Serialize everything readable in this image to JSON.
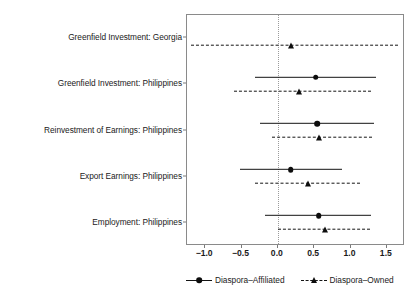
{
  "chart_data": {
    "type": "scatter",
    "subtype": "coefficient-forest-plot",
    "title": "",
    "subtitle": "",
    "xlabel": "",
    "ylabel": "",
    "xlim": [
      -1.25,
      1.75
    ],
    "xticks": [
      -1.0,
      -0.5,
      0.0,
      0.5,
      1.0,
      1.5
    ],
    "xticklabels": [
      "-1.0",
      "-0.5",
      "0.0",
      "0.5",
      "1.0",
      "1.5"
    ],
    "grid": false,
    "zero_reference_line": 0.0,
    "legend_position": "bottom",
    "categories": [
      "Greenfield Investment: Georgia",
      "Greenfield Investment: Philippines",
      "Reinvestment of Earnings: Philippines",
      "Export Earnings: Philippines",
      "Employment: Philippines"
    ],
    "series": [
      {
        "name": "Diaspora-Affiliated",
        "marker": "circle",
        "linestyle": "solid",
        "color": "#0d0d0d",
        "points": [
          {
            "category": "Greenfield Investment: Georgia",
            "estimate": null,
            "low": null,
            "high": null
          },
          {
            "category": "Greenfield Investment: Philippines",
            "estimate": 0.52,
            "low": -0.32,
            "high": 1.35
          },
          {
            "category": "Reinvestment of Earnings: Philippines",
            "estimate": 0.54,
            "low": -0.24,
            "high": 1.32
          },
          {
            "category": "Export Earnings: Philippines",
            "estimate": 0.18,
            "low": -0.52,
            "high": 0.89
          },
          {
            "category": "Employment: Philippines",
            "estimate": 0.56,
            "low": -0.18,
            "high": 1.28
          }
        ]
      },
      {
        "name": "Diaspora-Owned",
        "marker": "triangle",
        "linestyle": "dashed",
        "color": "#0d0d0d",
        "points": [
          {
            "category": "Greenfield Investment: Georgia",
            "estimate": 0.18,
            "low": -1.2,
            "high": 1.65
          },
          {
            "category": "Greenfield Investment: Philippines",
            "estimate": 0.29,
            "low": -0.6,
            "high": 1.28
          },
          {
            "category": "Reinvestment of Earnings: Philippines",
            "estimate": 0.57,
            "low": -0.08,
            "high": 1.29
          },
          {
            "category": "Export Earnings: Philippines",
            "estimate": 0.41,
            "low": -0.31,
            "high": 1.13
          },
          {
            "category": "Employment: Philippines",
            "estimate": 0.65,
            "low": 0.0,
            "high": 1.27
          }
        ]
      }
    ],
    "legend": [
      {
        "label": "Diaspora–Affiliated",
        "marker": "circle",
        "linestyle": "solid"
      },
      {
        "label": "Diaspora–Owned",
        "marker": "triangle",
        "linestyle": "dashed"
      }
    ]
  }
}
